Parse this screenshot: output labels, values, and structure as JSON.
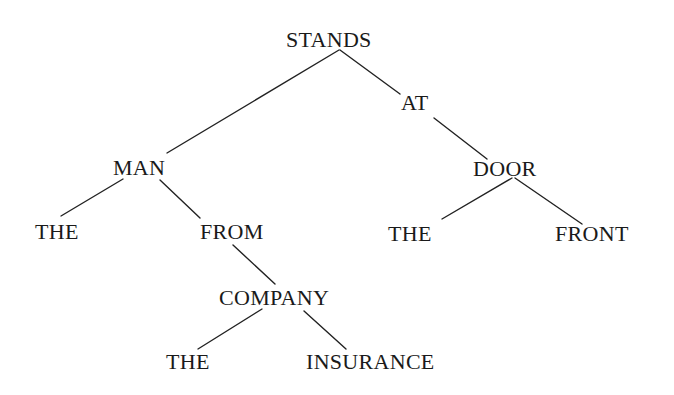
{
  "diagram": {
    "type": "dependency-tree",
    "nodes": {
      "stands": {
        "label": "STANDS",
        "x": 286,
        "y": 29
      },
      "at": {
        "label": "AT",
        "x": 401,
        "y": 92
      },
      "man": {
        "label": "MAN",
        "x": 113,
        "y": 157
      },
      "door": {
        "label": "DOOR",
        "x": 473,
        "y": 158
      },
      "the1": {
        "label": "THE",
        "x": 35,
        "y": 221
      },
      "from": {
        "label": "FROM",
        "x": 200,
        "y": 221
      },
      "the2": {
        "label": "THE",
        "x": 388,
        "y": 223
      },
      "front": {
        "label": "FRONT",
        "x": 555,
        "y": 223
      },
      "company": {
        "label": "COMPANY",
        "x": 219,
        "y": 287
      },
      "the3": {
        "label": "THE",
        "x": 166,
        "y": 351
      },
      "insurance": {
        "label": "INSURANCE",
        "x": 306,
        "y": 351
      }
    },
    "edges": [
      {
        "from": "STANDS",
        "to": "MAN",
        "x1": 339,
        "y1": 50,
        "x2": 167,
        "y2": 153
      },
      {
        "from": "STANDS",
        "to": "AT",
        "x1": 340,
        "y1": 50,
        "x2": 400,
        "y2": 94
      },
      {
        "from": "AT",
        "to": "DOOR",
        "x1": 434,
        "y1": 118,
        "x2": 487,
        "y2": 159
      },
      {
        "from": "MAN",
        "to": "THE",
        "x1": 123,
        "y1": 179,
        "x2": 61,
        "y2": 216
      },
      {
        "from": "MAN",
        "to": "FROM",
        "x1": 160,
        "y1": 180,
        "x2": 200,
        "y2": 218
      },
      {
        "from": "DOOR",
        "to": "THE",
        "x1": 512,
        "y1": 178,
        "x2": 442,
        "y2": 219
      },
      {
        "from": "DOOR",
        "to": "FRONT",
        "x1": 515,
        "y1": 178,
        "x2": 582,
        "y2": 224
      },
      {
        "from": "FROM",
        "to": "COMPANY",
        "x1": 233,
        "y1": 245,
        "x2": 275,
        "y2": 284
      },
      {
        "from": "COMPANY",
        "to": "THE",
        "x1": 262,
        "y1": 309,
        "x2": 198,
        "y2": 349
      },
      {
        "from": "COMPANY",
        "to": "INSURANCE",
        "x1": 304,
        "y1": 311,
        "x2": 346,
        "y2": 349
      }
    ]
  }
}
